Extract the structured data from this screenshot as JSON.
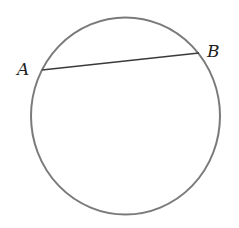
{
  "diagram": {
    "type": "circle-with-chord",
    "circle": {
      "cx": 125.5,
      "cy": 116,
      "rx": 94.5,
      "ry": 98.5,
      "stroke": "#7a7a7a",
      "stroke_width": 2
    },
    "chord": {
      "from": "A",
      "to": "B",
      "stroke": "#3a3a3a",
      "stroke_width": 1.5
    },
    "points": [
      {
        "name": "A",
        "x": 42,
        "y": 70,
        "label_x": 17,
        "label_y": 75
      },
      {
        "name": "B",
        "x": 199,
        "y": 53,
        "label_x": 207,
        "label_y": 57
      }
    ],
    "labels": {
      "A": "A",
      "B": "B"
    }
  }
}
